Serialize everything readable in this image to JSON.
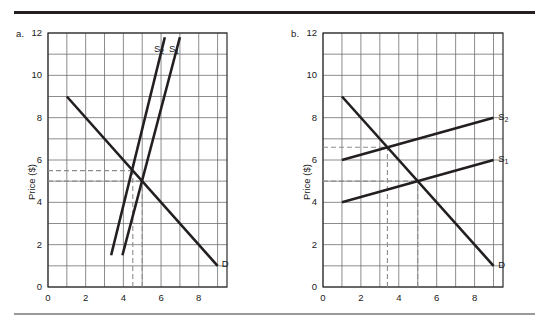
{
  "figure": {
    "panels": [
      {
        "id": "a",
        "label": "a.",
        "ylabel": "Price ($)",
        "yticks": [
          0,
          2,
          4,
          6,
          8,
          10,
          12
        ],
        "xticks": [
          0,
          2,
          4,
          6,
          8
        ],
        "curve_labels": [
          {
            "name": "S2",
            "text": "S",
            "sub": "2"
          },
          {
            "name": "S1",
            "text": "S",
            "sub": "1"
          },
          {
            "name": "D",
            "text": "D",
            "sub": ""
          }
        ]
      },
      {
        "id": "b",
        "label": "b.",
        "ylabel": "Price ($)",
        "yticks": [
          0,
          2,
          4,
          6,
          8,
          10,
          12
        ],
        "xticks": [
          0,
          2,
          4,
          6,
          8
        ],
        "curve_labels": [
          {
            "name": "S2",
            "text": "S",
            "sub": "2"
          },
          {
            "name": "S1",
            "text": "S",
            "sub": "1"
          },
          {
            "name": "D",
            "text": "D",
            "sub": ""
          }
        ]
      }
    ]
  },
  "chart_data": [
    {
      "type": "line",
      "panel": "a",
      "title": "",
      "xlabel": "",
      "ylabel": "Price ($)",
      "xlim": [
        0,
        9.5
      ],
      "ylim": [
        0,
        12
      ],
      "xticks": [
        0,
        2,
        4,
        6,
        8
      ],
      "yticks": [
        0,
        2,
        4,
        6,
        8,
        10,
        12
      ],
      "grid": true,
      "grid_spacing": {
        "x": 1,
        "y": 1
      },
      "legend": "inline-labels",
      "series": [
        {
          "name": "D",
          "label": "D",
          "points": [
            [
              1,
              9
            ],
            [
              9,
              1
            ]
          ],
          "color": "#231f20"
        },
        {
          "name": "S1",
          "label": "S1",
          "points": [
            [
              3.95,
              1.5
            ],
            [
              7.0,
              11.8
            ]
          ],
          "color": "#231f20"
        },
        {
          "name": "S2",
          "label": "S2",
          "points": [
            [
              3.35,
              1.5
            ],
            [
              6.2,
              11.8
            ]
          ],
          "color": "#231f20"
        }
      ],
      "equilibria": [
        {
          "name": "original",
          "x": 5.0,
          "y": 5.0,
          "on": "S1"
        },
        {
          "name": "shifted",
          "x": 4.5,
          "y": 5.5,
          "on": "S2"
        }
      ],
      "guide_lines": [
        {
          "orientation": "horizontal",
          "value": 5.5,
          "from_x": 0,
          "to_x": 4.5,
          "style": "dashed"
        },
        {
          "orientation": "horizontal",
          "value": 5.0,
          "from_x": 0,
          "to_x": 5.0,
          "style": "dashed"
        },
        {
          "orientation": "vertical",
          "value": 4.5,
          "from_y": 0,
          "to_y": 5.5,
          "style": "dashed"
        },
        {
          "orientation": "vertical",
          "value": 5.0,
          "from_y": 0,
          "to_y": 5.0,
          "style": "dashed"
        }
      ]
    },
    {
      "type": "line",
      "panel": "b",
      "title": "",
      "xlabel": "",
      "ylabel": "Price ($)",
      "xlim": [
        0,
        9.5
      ],
      "ylim": [
        0,
        12
      ],
      "xticks": [
        0,
        2,
        4,
        6,
        8
      ],
      "yticks": [
        0,
        2,
        4,
        6,
        8,
        10,
        12
      ],
      "grid": true,
      "grid_spacing": {
        "x": 1,
        "y": 1
      },
      "legend": "inline-labels",
      "series": [
        {
          "name": "D",
          "label": "D",
          "points": [
            [
              1,
              9
            ],
            [
              9,
              1
            ]
          ],
          "color": "#231f20"
        },
        {
          "name": "S1",
          "label": "S1",
          "points": [
            [
              1,
              4
            ],
            [
              9,
              6
            ]
          ],
          "color": "#231f20"
        },
        {
          "name": "S2",
          "label": "S2",
          "points": [
            [
              1,
              6
            ],
            [
              9,
              8
            ]
          ],
          "color": "#231f20"
        }
      ],
      "equilibria": [
        {
          "name": "original",
          "x": 5.0,
          "y": 5.0,
          "on": "S1"
        },
        {
          "name": "shifted",
          "x": 3.4,
          "y": 6.6,
          "on": "S2"
        }
      ],
      "guide_lines": [
        {
          "orientation": "horizontal",
          "value": 6.6,
          "from_x": 0,
          "to_x": 3.4,
          "style": "dashed"
        },
        {
          "orientation": "horizontal",
          "value": 5.0,
          "from_x": 0,
          "to_x": 5.0,
          "style": "dashed"
        },
        {
          "orientation": "vertical",
          "value": 3.4,
          "from_y": 0,
          "to_y": 6.6,
          "style": "dashed"
        },
        {
          "orientation": "vertical",
          "value": 5.0,
          "from_y": 0,
          "to_y": 5.0,
          "style": "dashed"
        }
      ]
    }
  ]
}
